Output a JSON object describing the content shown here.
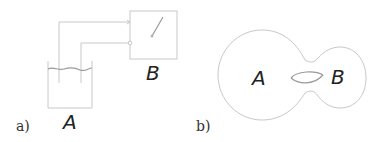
{
  "figure": {
    "panel_a": {
      "label": "a)",
      "container_label": "A",
      "switch_box_label": "B"
    },
    "panel_b": {
      "label": "b)",
      "region_a_label": "A",
      "region_b_label": "B"
    }
  },
  "colors": {
    "line": "#c8c8c8",
    "text": "#222222"
  }
}
